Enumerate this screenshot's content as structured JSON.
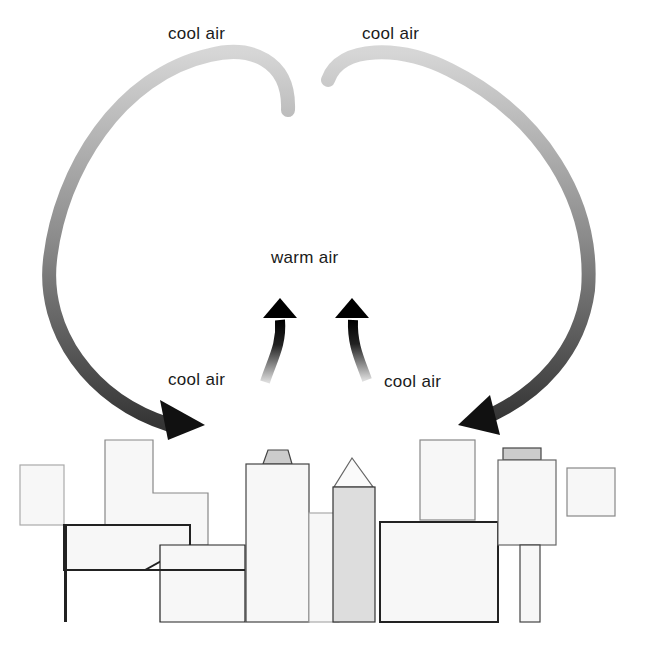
{
  "diagram": {
    "labels": {
      "top_left": "cool air",
      "top_right": "cool air",
      "center": "warm air",
      "lower_left": "cool air",
      "lower_right": "cool air"
    },
    "colors": {
      "ink": "#111111",
      "shade": "#9a9a9a",
      "background": "#ffffff"
    }
  }
}
